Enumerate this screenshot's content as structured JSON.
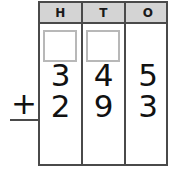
{
  "worksheet": {
    "type": "column-addition",
    "operator": "+",
    "columns": [
      {
        "key": "hundreds",
        "header": "H"
      },
      {
        "key": "tens",
        "header": "T"
      },
      {
        "key": "ones",
        "header": "O"
      }
    ],
    "carry_boxes": [
      {
        "column": "hundreds",
        "value": ""
      },
      {
        "column": "tens",
        "value": ""
      }
    ],
    "addend_1": {
      "hundreds": "3",
      "tens": "4",
      "ones": "5"
    },
    "addend_2": {
      "hundreds": "2",
      "tens": "9",
      "ones": "3"
    },
    "answer": {
      "hundreds": "",
      "tens": "",
      "ones": ""
    },
    "colors": {
      "grid_line": "#4a4a4a",
      "header_fill": "#d4d4d4",
      "carry_box_border": "#b8b8b8",
      "digit": "#111111",
      "background": "#ffffff"
    }
  }
}
